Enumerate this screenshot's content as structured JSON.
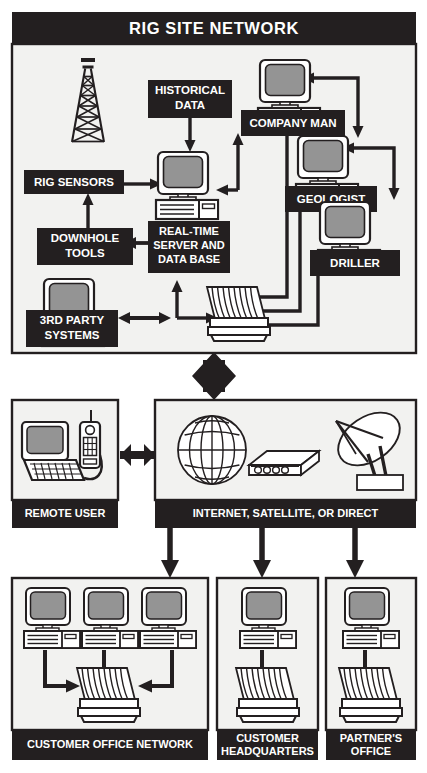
{
  "document": {
    "title": "RIG SITE NETWORK",
    "type": "network-topology-diagram"
  },
  "colors": {
    "label_bar_fill": "#231f20",
    "label_text": "#ffffff",
    "panel_fill": "#f2f2f0",
    "panel_stroke": "#231f20",
    "page_background": "#ffffff",
    "line": "#231f20",
    "screen_gray": "#949494",
    "device_fill": "#ffffff"
  },
  "panels": [
    {
      "id": "rig-site-network",
      "label": "RIG SITE NETWORK",
      "label_position": "top",
      "x": 12,
      "y": 12,
      "w": 404,
      "h": 341
    },
    {
      "id": "remote-user",
      "label": "REMOTE USER",
      "label_position": "bottom",
      "x": 12,
      "y": 400,
      "w": 106,
      "h": 128
    },
    {
      "id": "internet-satellite-or-direct",
      "label": "INTERNET, SATELLITE, OR DIRECT",
      "label_position": "bottom",
      "x": 155,
      "y": 400,
      "w": 261,
      "h": 128
    },
    {
      "id": "customer-office-network",
      "label": "CUSTOMER OFFICE NETWORK",
      "label_position": "bottom",
      "x": 12,
      "y": 578,
      "w": 196,
      "h": 182
    },
    {
      "id": "customer-headquarters",
      "label": "CUSTOMER\nHEADQUARTERS",
      "label_lines": [
        "CUSTOMER",
        "HEADQUARTERS"
      ],
      "label_position": "bottom",
      "x": 217,
      "y": 578,
      "w": 101,
      "h": 182
    },
    {
      "id": "partners-office",
      "label": "PARTNER'S\nOFFICE",
      "label_lines": [
        "PARTNER'S",
        "OFFICE"
      ],
      "label_position": "bottom",
      "x": 326,
      "y": 578,
      "w": 90,
      "h": 182
    }
  ],
  "nodes": [
    {
      "id": "rig-sensors",
      "label_lines": [
        "RIG SENSORS"
      ],
      "panel": "rig-site-network",
      "icon": "derrick"
    },
    {
      "id": "downhole-tools",
      "label_lines": [
        "DOWNHOLE",
        "TOOLS"
      ],
      "panel": "rig-site-network",
      "icon": "none"
    },
    {
      "id": "historical-data",
      "label_lines": [
        "HISTORICAL",
        "DATA"
      ],
      "panel": "rig-site-network",
      "icon": "none"
    },
    {
      "id": "real-time-server",
      "label_lines": [
        "REAL-TIME",
        "SERVER AND",
        "DATA BASE"
      ],
      "panel": "rig-site-network",
      "icon": "desktop-computer"
    },
    {
      "id": "third-party-systems",
      "label_lines": [
        "3RD PARTY",
        "SYSTEMS"
      ],
      "panel": "rig-site-network",
      "icon": "desktop-computer"
    },
    {
      "id": "company-man",
      "label_lines": [
        "COMPANY MAN"
      ],
      "panel": "rig-site-network",
      "icon": "desktop-computer"
    },
    {
      "id": "geologist",
      "label_lines": [
        "GEOLOGIST"
      ],
      "panel": "rig-site-network",
      "icon": "desktop-computer"
    },
    {
      "id": "driller",
      "label_lines": [
        "DRILLER"
      ],
      "panel": "rig-site-network",
      "icon": "desktop-computer"
    },
    {
      "id": "rig-plotter",
      "label_lines": [],
      "panel": "rig-site-network",
      "icon": "plotter-printer"
    }
  ],
  "icons": {
    "derrick": "drilling-rig-derrick-icon",
    "desktop": "desktop-computer-icon",
    "plotter": "plotter-printer-icon",
    "laptop": "laptop-computer-icon",
    "mobile": "mobile-phone-icon",
    "globe": "globe-icon",
    "modem": "modem-icon",
    "satellite": "satellite-dish-icon",
    "arrow": "arrow-icon",
    "double_arrow": "double-headed-arrow-icon"
  },
  "connections": [
    {
      "from": "downhole-tools",
      "to": "rig-sensors",
      "style": "single"
    },
    {
      "from": "rig-sensors",
      "to": "real-time-server",
      "style": "single"
    },
    {
      "from": "historical-data",
      "to": "real-time-server",
      "style": "single"
    },
    {
      "from": "downhole-tools",
      "to": "real-time-server",
      "style": "double"
    },
    {
      "from": "third-party-systems",
      "to": "real-time-server",
      "style": "double"
    },
    {
      "from": "third-party-systems",
      "to": "rig-plotter",
      "style": "single"
    },
    {
      "from": "real-time-server",
      "to": "rig-plotter",
      "style": "single"
    },
    {
      "from": "company-man",
      "to": "real-time-server",
      "style": "single"
    },
    {
      "from": "real-time-server",
      "to": "company-man",
      "style": "single"
    },
    {
      "from": "company-man",
      "to": "geologist",
      "style": "single"
    },
    {
      "from": "geologist",
      "to": "driller",
      "style": "single"
    },
    {
      "from": "company-man",
      "to": "rig-plotter",
      "style": "single"
    },
    {
      "from": "geologist",
      "to": "rig-plotter",
      "style": "single"
    },
    {
      "from": "driller",
      "to": "rig-plotter",
      "style": "single"
    },
    {
      "from": "rig-site-network",
      "to": "internet-satellite-or-direct",
      "style": "double-vertical-thick"
    },
    {
      "from": "remote-user",
      "to": "internet-satellite-or-direct",
      "style": "double-horizontal-thick"
    },
    {
      "from": "internet-satellite-or-direct",
      "to": "customer-office-network",
      "style": "thick-down"
    },
    {
      "from": "internet-satellite-or-direct",
      "to": "customer-headquarters",
      "style": "thick-down"
    },
    {
      "from": "internet-satellite-or-direct",
      "to": "partners-office",
      "style": "thick-down"
    }
  ],
  "internet_box_icons": [
    {
      "id": "globe",
      "name": "globe-icon"
    },
    {
      "id": "modem",
      "name": "modem-icon"
    },
    {
      "id": "satellite-dish",
      "name": "satellite-dish-icon"
    }
  ],
  "office_network": {
    "workstation_count": 3,
    "has_plotter": true
  },
  "headquarters": {
    "workstation_count": 1,
    "has_plotter": true
  },
  "partners_office": {
    "workstation_count": 1,
    "has_plotter": true
  }
}
